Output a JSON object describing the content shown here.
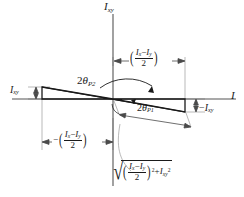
{
  "figure": {
    "type": "mechanics-diagram",
    "background_color": "#ffffff",
    "line_color": "#1a1a1a",
    "width": 244,
    "height": 197
  },
  "axes": {
    "horizontal": {
      "name": "I-axis",
      "label": "I",
      "label_italic": true,
      "y": 99,
      "x_start": 12,
      "x_end": 236
    },
    "vertical": {
      "name": "Ixy-axis",
      "label_base": "I",
      "label_sub": "xy",
      "x": 113,
      "y_start": 14,
      "y_end": 186
    },
    "origin": {
      "x": 113,
      "y": 99
    }
  },
  "labels": {
    "axis_vertical": {
      "base": "I",
      "sub": "xy"
    },
    "axis_horizontal": {
      "base": "I",
      "sub": ""
    },
    "left_ixy": {
      "base": "I",
      "sub": "xy"
    },
    "right_neg_ixy": {
      "prefix": "−",
      "base": "I",
      "sub": "xy"
    },
    "angle_p2": {
      "value": "2",
      "theta": "θ",
      "sub": "P2"
    },
    "angle_p1": {
      "value": "2",
      "theta": "θ",
      "sub": "P1"
    },
    "dim_top_right": {
      "sign": "",
      "num_a": "I",
      "num_a_sub": "x",
      "minus": "−",
      "num_b": "I",
      "num_b_sub": "y",
      "den": "2"
    },
    "dim_bottom_left": {
      "sign": "−",
      "num_a": "I",
      "num_a_sub": "x",
      "minus": "−",
      "num_b": "I",
      "num_b_sub": "y",
      "den": "2"
    },
    "radical_expr": {
      "radical": "√",
      "num_a": "I",
      "num_a_sub": "x",
      "minus": "−",
      "num_b": "I",
      "num_b_sub": "y",
      "den": "2",
      "outer_power": "2",
      "plus": "+",
      "term2": "I",
      "term2_sub": "xy",
      "term2_power": "2"
    }
  },
  "geometry": {
    "left_triangle": {
      "name": "left-triangle",
      "points": "42,87 113,99 42,99",
      "description": "triangle left of origin above the I axis, height = Ixy"
    },
    "right_triangle": {
      "name": "right-triangle",
      "points": "113,99 185,99 185,112",
      "description": "triangle right of origin below the I axis, depth = -Ixy"
    },
    "arc_p2": {
      "name": "angle-arc-2theta-P2",
      "path": "M 104,83 A 42,42 0 0 1 150,93"
    },
    "arc_p1": {
      "name": "angle-arc-2theta-P1",
      "path": "M 129,101 A 20,20 0 0 0 131,104"
    },
    "hypotenuse_dim": {
      "name": "hypotenuse-dimension-line",
      "from": {
        "x": 119,
        "y": 114
      },
      "to": {
        "x": 191,
        "y": 127
      }
    }
  },
  "dimension_lines": [
    {
      "name": "dim-top-right",
      "y": 61,
      "x1": 116,
      "x2": 185
    },
    {
      "name": "dim-bottom-left",
      "y": 142,
      "x1": 42,
      "x2": 111
    },
    {
      "name": "dim-left-ixy",
      "x": 36,
      "y1": 87,
      "y2": 99
    },
    {
      "name": "dim-right-ixy",
      "x": 196,
      "y1": 99,
      "y2": 112
    }
  ]
}
